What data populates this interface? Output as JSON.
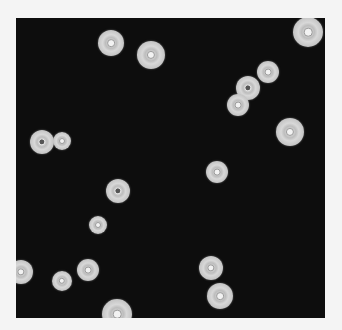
{
  "image": {
    "description": "Dark-field microscopy of round light-gray cells on black background",
    "background_color": "#0d0d0d",
    "border_color": "#f4f4f4",
    "cells": [
      {
        "x": 111,
        "y": 43,
        "r": 13,
        "core": "light"
      },
      {
        "x": 151,
        "y": 55,
        "r": 14,
        "core": "light"
      },
      {
        "x": 308,
        "y": 32,
        "r": 15,
        "core": "light"
      },
      {
        "x": 268,
        "y": 72,
        "r": 11,
        "core": "light"
      },
      {
        "x": 248,
        "y": 88,
        "r": 12,
        "core": "dark"
      },
      {
        "x": 238,
        "y": 105,
        "r": 11,
        "core": "light"
      },
      {
        "x": 290,
        "y": 132,
        "r": 14,
        "core": "light"
      },
      {
        "x": 42,
        "y": 142,
        "r": 12,
        "core": "dark"
      },
      {
        "x": 62,
        "y": 141,
        "r": 9,
        "core": "light"
      },
      {
        "x": 217,
        "y": 172,
        "r": 11,
        "core": "light"
      },
      {
        "x": 118,
        "y": 191,
        "r": 12,
        "core": "dark"
      },
      {
        "x": 98,
        "y": 225,
        "r": 9,
        "core": "light"
      },
      {
        "x": 21,
        "y": 272,
        "r": 12,
        "core": "light"
      },
      {
        "x": 62,
        "y": 281,
        "r": 10,
        "core": "light"
      },
      {
        "x": 88,
        "y": 270,
        "r": 11,
        "core": "light"
      },
      {
        "x": 117,
        "y": 314,
        "r": 15,
        "core": "light"
      },
      {
        "x": 211,
        "y": 268,
        "r": 12,
        "core": "light"
      },
      {
        "x": 220,
        "y": 296,
        "r": 13,
        "core": "light"
      }
    ]
  }
}
